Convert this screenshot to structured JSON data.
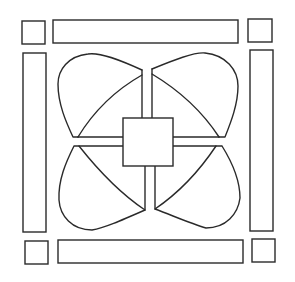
{
  "figure": {
    "stroke_color": "#2a2a2a",
    "background": "#ffffff",
    "center_square": {
      "x": 123,
      "y": 118,
      "w": 50,
      "h": 48
    },
    "corner_squares": [
      {
        "name": "top-left",
        "x": 22,
        "y": 21,
        "w": 23,
        "h": 23
      },
      {
        "name": "top-right",
        "x": 248,
        "y": 19,
        "w": 24,
        "h": 23
      },
      {
        "name": "bottom-left",
        "x": 25,
        "y": 241,
        "w": 23,
        "h": 23
      },
      {
        "name": "bottom-right",
        "x": 252,
        "y": 239,
        "w": 23,
        "h": 23
      }
    ],
    "bars": [
      {
        "name": "top",
        "x": 53,
        "y": 20,
        "w": 185,
        "h": 23
      },
      {
        "name": "left",
        "x": 23,
        "y": 53,
        "w": 23,
        "h": 179
      },
      {
        "name": "right",
        "x": 250,
        "y": 50,
        "w": 23,
        "h": 181
      },
      {
        "name": "bottom",
        "x": 58,
        "y": 240,
        "w": 185,
        "h": 23
      }
    ],
    "petals": [
      "top-left",
      "top-right",
      "bottom-left",
      "bottom-right"
    ]
  }
}
